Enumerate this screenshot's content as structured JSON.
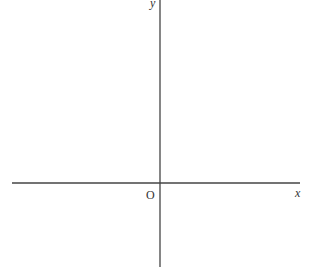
{
  "diagram": {
    "type": "coordinate-axes",
    "axis_color": "#444444",
    "labels": {
      "x_axis": "x",
      "y_axis": "y",
      "origin": "O"
    }
  }
}
